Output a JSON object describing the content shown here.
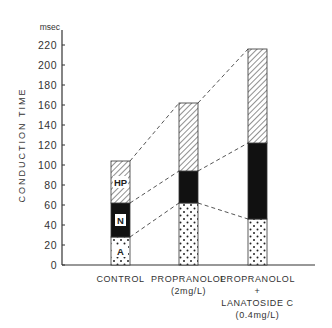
{
  "chart_data": {
    "type": "bar",
    "stacked": true,
    "title": "",
    "xlabel": "",
    "ylabel": "CONDUCTION   TIME",
    "yunit": "msec",
    "ylim": [
      0,
      230
    ],
    "yticks": [
      0,
      20,
      40,
      60,
      80,
      100,
      120,
      140,
      160,
      180,
      200,
      220
    ],
    "categories": [
      [
        "CONTROL"
      ],
      [
        "PROPRANOLOL",
        "(2mg/L)"
      ],
      [
        "PROPRANOLOL",
        "+",
        "LANATOSIDE C",
        "(0.4mg/L)"
      ]
    ],
    "series": [
      {
        "name": "A",
        "pattern": "dots",
        "values": [
          28,
          62,
          46
        ]
      },
      {
        "name": "N",
        "pattern": "solid-black",
        "values": [
          34,
          32,
          76
        ]
      },
      {
        "name": "HP",
        "pattern": "diagonal-hatch",
        "values": [
          42,
          68,
          94
        ]
      }
    ],
    "cumulative_tops": {
      "A": [
        28,
        62,
        46
      ],
      "N": [
        62,
        94,
        122
      ],
      "HP": [
        104,
        162,
        216
      ]
    },
    "segment_labels_shown_on": "CONTROL",
    "connectors": "dashed lines joining segment boundaries between adjacent bars",
    "grid": false,
    "legend": "none (segments labeled inside first bar: HP, N, A)"
  }
}
